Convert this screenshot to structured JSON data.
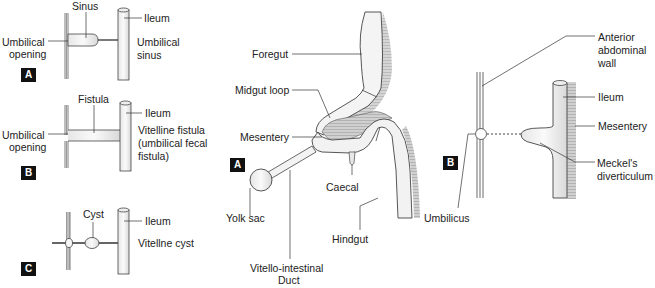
{
  "panels": {
    "left_a": {
      "badge": "A",
      "labels": {
        "sinus": "Sinus",
        "ileum": "Ileum",
        "umbilical_opening_1": "Umbilical",
        "umbilical_opening_2": "opening",
        "caption_1": "Umbilical",
        "caption_2": "sinus"
      }
    },
    "left_b": {
      "badge": "B",
      "labels": {
        "fistula": "Fistula",
        "ileum": "Ileum",
        "umbilical_opening_1": "Umbilical",
        "umbilical_opening_2": "opening",
        "caption_1": "Vitelline fistula",
        "caption_2": "(umbilical fecal",
        "caption_3": "fistula)"
      }
    },
    "left_c": {
      "badge": "C",
      "labels": {
        "cyst": "Cyst",
        "ileum": "Ileum",
        "caption": "Vitellne cyst"
      }
    },
    "center": {
      "badge": "A",
      "labels": {
        "foregut": "Foregut",
        "midgut_loop": "Midgut loop",
        "mesentery": "Mesentery",
        "yolk_sac": "Yolk sac",
        "caecal": "Caecal",
        "hindgut": "Hindgut",
        "vitello_1": "Vitello-intestinal",
        "vitello_2": "Duct"
      }
    },
    "right": {
      "badge": "B",
      "labels": {
        "anterior_1": "Anterior",
        "anterior_2": "abdominal",
        "anterior_3": "wall",
        "ileum": "Ileum",
        "mesentery": "Mesentery",
        "meckels_1": "Meckel's",
        "meckels_2": "diverticulum",
        "umbilicus": "Umbilicus"
      }
    }
  },
  "colors": {
    "line": "#333333",
    "tube_fill": "#f2f2f2",
    "hatch": "#8a8a8a",
    "shade": "#c8c8c8",
    "badge_bg": "#111111"
  }
}
